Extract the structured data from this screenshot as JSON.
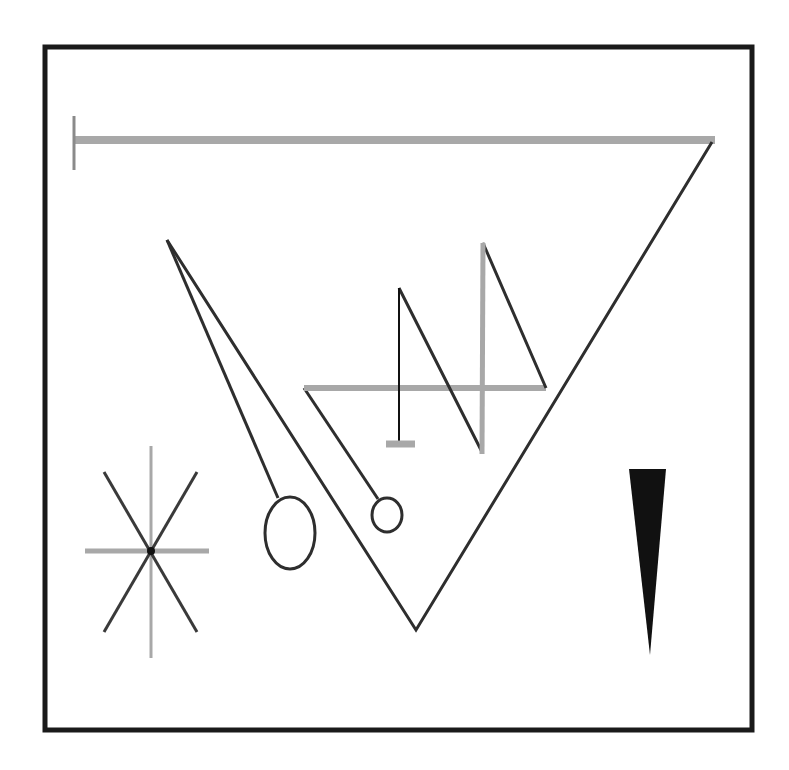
{
  "title": "Abstract geometric line composition",
  "colors": {
    "background": "#ffffff",
    "frame": "#1a1a1a",
    "stroke_dark": "#2e2e2e",
    "stroke_gray": "#a8a8a8",
    "fill_black": "#111111"
  },
  "frame": {
    "x": 45,
    "y": 47,
    "width": 707,
    "height": 683,
    "stroke_width": 5
  },
  "elements": {
    "top_bar": {
      "x1": 74,
      "y1": 140,
      "x2": 715,
      "y2": 140,
      "cap_x": 74,
      "cap_y1": 116,
      "cap_y2": 170
    },
    "big_v": {
      "left_x": 167,
      "left_y": 240,
      "bottom_x": 416,
      "bottom_y": 630,
      "right_x": 712,
      "right_y": 142
    },
    "needle_line": {
      "x1": 167,
      "y1": 240,
      "x2": 278,
      "y2": 498
    },
    "big_ellipse": {
      "cx": 290,
      "cy": 533,
      "rx": 25,
      "ry": 36
    },
    "stick_line": {
      "x1": 304,
      "y1": 388,
      "x2": 378,
      "y2": 499
    },
    "small_circle": {
      "cx": 387,
      "cy": 515,
      "rx": 15,
      "ry": 17
    },
    "gray_horizontal": {
      "x1": 304,
      "y1": 388,
      "x2": 546,
      "y2": 388
    },
    "black_vertical": {
      "x": 399,
      "y1": 288,
      "y2": 443
    },
    "vertical_foot": {
      "x1": 386,
      "x2": 415,
      "y": 444
    },
    "zigzag": {
      "points": "399,288 482,452 483,243 546,388"
    },
    "star": {
      "cx": 151,
      "cy": 551,
      "v_top": 446,
      "v_bottom": 658,
      "h_left": 85,
      "h_right": 209,
      "d_x1": 104,
      "d_y1": 472,
      "d_x2": 197,
      "d_y2": 632
    },
    "wedge": {
      "points": "629,469 666,469 650,655"
    }
  }
}
